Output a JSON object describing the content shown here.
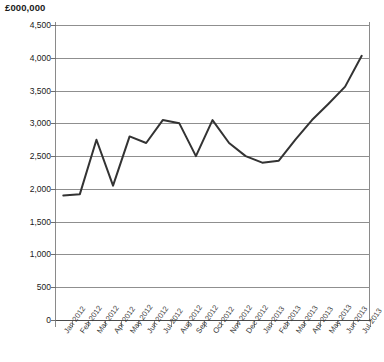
{
  "chart_data": {
    "type": "line",
    "title": "",
    "ylabel": "£000,000",
    "xlabel": "",
    "ylim": [
      0,
      4500
    ],
    "ytick_step": 500,
    "grid": true,
    "legend": false,
    "line_color": "#333333",
    "categories": [
      "Jan 2012",
      "Feb 2012",
      "Mar 2012",
      "Apr 2012",
      "May 2012",
      "Jun 2012",
      "Jul 2012",
      "Aug 2012",
      "Sep 2012",
      "Oct 2012",
      "Nov 2012",
      "Dec 2012",
      "Jan 2013",
      "Feb 2013",
      "Mar 2013",
      "Apr 2013",
      "May 2013",
      "Jun 2013",
      "Jul 2013"
    ],
    "values": [
      1900,
      1920,
      2750,
      2050,
      2800,
      2700,
      3050,
      3000,
      2500,
      3050,
      2700,
      2500,
      2400,
      2430,
      2750,
      3050,
      3300,
      3560,
      4030
    ],
    "ytick_labels": [
      "4,500",
      "4,000",
      "3,500",
      "3,000",
      "2,500",
      "2,000",
      "1,500",
      "1,000",
      "500",
      "0"
    ],
    "ytick_values": [
      4500,
      4000,
      3500,
      3000,
      2500,
      2000,
      1500,
      1000,
      500,
      0
    ]
  }
}
